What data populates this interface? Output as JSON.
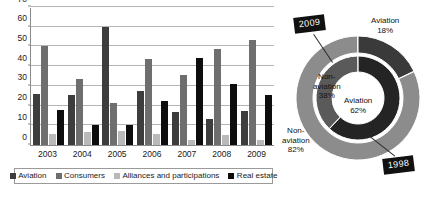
{
  "chart_data": [
    {
      "type": "bar",
      "title": "",
      "xlabel": "",
      "ylabel": "",
      "ylim": [
        0,
        70
      ],
      "yticks": [
        0,
        10,
        20,
        30,
        40,
        50,
        60,
        70
      ],
      "grid": true,
      "legend_position": "bottom",
      "categories": [
        "2003",
        "2004",
        "2005",
        "2006",
        "2007",
        "2008",
        "2009"
      ],
      "series": [
        {
          "name": "Aviation",
          "color": "#3d3d3d",
          "values": [
            26,
            25.5,
            60,
            27.5,
            16.5,
            13,
            17.5
          ]
        },
        {
          "name": "Consumers",
          "color": "#6e6e6e",
          "values": [
            50,
            33.5,
            21.5,
            43.5,
            35.5,
            48.5,
            53.5
          ]
        },
        {
          "name": "Alliances and participations",
          "color": "#b9b9b9",
          "values": [
            5.5,
            6.5,
            7,
            5.5,
            2.5,
            5,
            2.5
          ]
        },
        {
          "name": "Real estate",
          "color": "#0d0d0d",
          "values": [
            18,
            10,
            10,
            22.5,
            44,
            31,
            25.5
          ]
        }
      ]
    },
    {
      "type": "pie",
      "subtype": "nested-donut",
      "title": "",
      "rings": [
        {
          "name": "2009",
          "position": "outer",
          "labels": [
            "Aviation",
            "Non-aviation"
          ],
          "values": [
            18,
            82
          ],
          "value_labels": [
            "18%",
            "82%"
          ],
          "colors": [
            "#3a3a3a",
            "#8c8c8c"
          ]
        },
        {
          "name": "1998",
          "position": "inner",
          "labels": [
            "Aviation",
            "Non-aviation"
          ],
          "values": [
            62,
            38
          ],
          "value_labels": [
            "62%",
            "38%"
          ],
          "colors": [
            "#242424",
            "#5a5a5a"
          ]
        }
      ]
    }
  ],
  "bar_chart": {
    "y_axis": {
      "ticks": [
        "0",
        "10",
        "20",
        "30",
        "40",
        "50",
        "60",
        "70"
      ]
    },
    "x_axis": {
      "labels": [
        "2003",
        "2004",
        "2005",
        "2006",
        "2007",
        "2008",
        "2009"
      ]
    },
    "legend": [
      {
        "label": "Aviation",
        "color": "#3d3d3d"
      },
      {
        "label": "Consumers",
        "color": "#6e6e6e"
      },
      {
        "label": "Alliances and participations",
        "color": "#b9b9b9"
      },
      {
        "label": "Real estate",
        "color": "#0d0d0d"
      }
    ]
  },
  "donut_chart": {
    "callouts": {
      "outer_year": "2009",
      "inner_year": "1998"
    },
    "outer_ring": {
      "aviation_label": "Aviation",
      "aviation_value": "18%",
      "nonaviation_label": "Non-\naviation",
      "nonaviation_line1": "Non-",
      "nonaviation_line2": "aviation",
      "nonaviation_value": "82%"
    },
    "inner_ring": {
      "aviation_label": "Aviation",
      "aviation_value": "62%",
      "nonaviation_line1": "Non-",
      "nonaviation_line2": "aviation",
      "nonaviation_value": "38%"
    }
  }
}
